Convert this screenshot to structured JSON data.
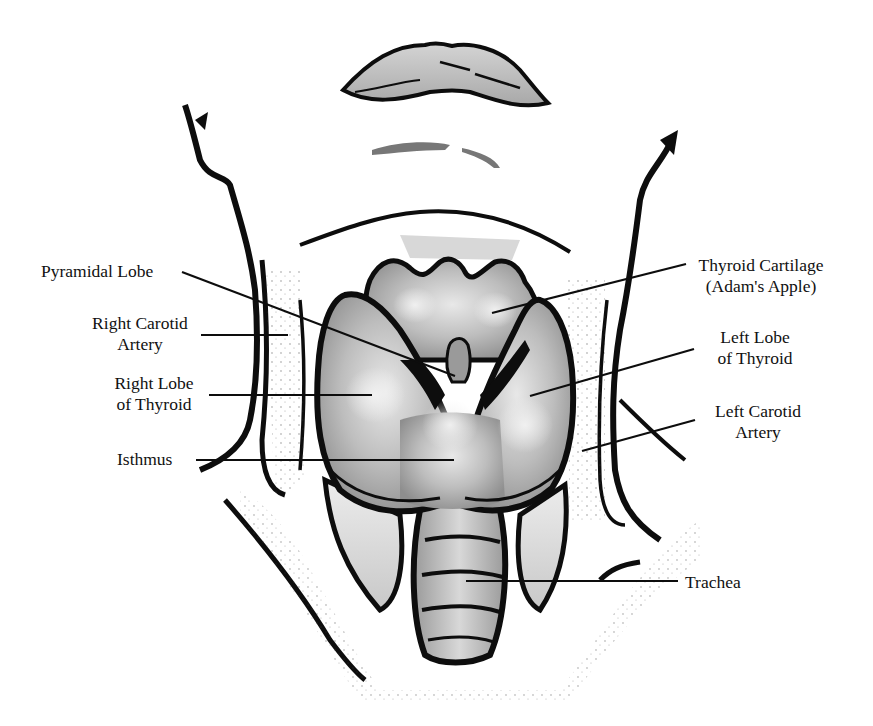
{
  "diagram": {
    "type": "anatomical-illustration",
    "colors": {
      "ink": "#0d0d0d",
      "gland_fill": "#b9b9b9",
      "gland_highlight": "#e6e6e6",
      "background": "#ffffff"
    },
    "labels": {
      "pyramidal_lobe": {
        "line1": "Pyramidal Lobe"
      },
      "right_carotid": {
        "line1": "Right Carotid",
        "line2": "Artery"
      },
      "right_lobe": {
        "line1": "Right Lobe",
        "line2": "of Thyroid"
      },
      "isthmus": {
        "line1": "Isthmus"
      },
      "thyroid_cartilage": {
        "line1": "Thyroid Cartilage",
        "line2": "(Adam's Apple)"
      },
      "left_lobe": {
        "line1": "Left Lobe",
        "line2": "of Thyroid"
      },
      "left_carotid": {
        "line1": "Left Carotid",
        "line2": "Artery"
      },
      "trachea": {
        "line1": "Trachea"
      }
    }
  }
}
